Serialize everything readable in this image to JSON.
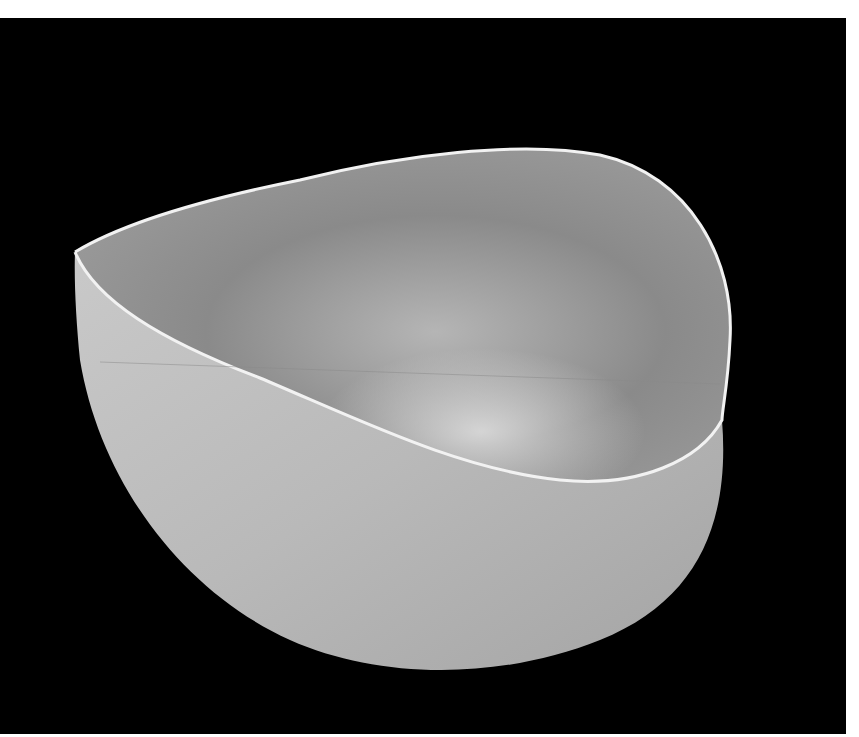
{
  "image": {
    "subject": "gray ceramic bowl",
    "background_color": "#000000",
    "frame_color": "#ffffff",
    "bowl_colors": {
      "outer": "#b8b8b8",
      "inner": "#8e8e8e",
      "rim": "#f2f2f2"
    }
  }
}
